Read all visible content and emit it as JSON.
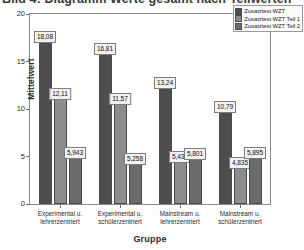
{
  "title": "Bild 4: Diagramm Werte gesamt nach Teilwerten",
  "legend": {
    "position": "top-right",
    "items": [
      {
        "label": "Zusatztest WZT",
        "color": "#4e4e4e"
      },
      {
        "label": "Zusatztest WZT Teil 1",
        "color": "#8d8d8d"
      },
      {
        "label": "Zusatztest WZT Teil 2",
        "color": "#6b6b6b"
      }
    ]
  },
  "axes": {
    "ylabel": "Mittelwert",
    "xlabel": "Gruppe",
    "yticks": [
      "20",
      "15",
      "10",
      "5",
      "0"
    ]
  },
  "chart_data": {
    "type": "bar",
    "title": "Bild 4: Diagramm Werte gesamt nach Teilwerten",
    "xlabel": "Gruppe",
    "ylabel": "Mittelwert",
    "ylim": [
      0,
      20
    ],
    "yticks": [
      0,
      5,
      10,
      15,
      20
    ],
    "grid": false,
    "legend_position": "top-right",
    "categories": [
      "Experimental u. lehrerzentriert",
      "Experimental u. schülerzentriert",
      "Mainstream u. lehrerzentriert",
      "Mainstream u. schülerzentriert"
    ],
    "series": [
      {
        "name": "Zusatztest WZT",
        "color": "#4e4e4e",
        "values": [
          18.08,
          16.81,
          13.24,
          10.79
        ],
        "labels": [
          "18,08",
          "16,81",
          "13,24",
          "10,79"
        ]
      },
      {
        "name": "Zusatztest WZT Teil 1",
        "color": "#8d8d8d",
        "values": [
          12.11,
          11.57,
          5.439,
          4.835
        ],
        "labels": [
          "12,11",
          "11,57",
          "5,439",
          "4,835"
        ]
      },
      {
        "name": "Zusatztest WZT Teil 2",
        "color": "#6b6b6b",
        "values": [
          5.943,
          5.258,
          5.801,
          5.895
        ],
        "labels": [
          "5,943",
          "5,258",
          "5,801",
          "5,895"
        ]
      }
    ]
  }
}
